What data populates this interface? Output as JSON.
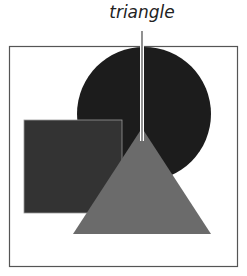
{
  "diagram": {
    "callout_label": "triangle",
    "shapes": [
      {
        "name": "circle",
        "color": "#1c1c1c"
      },
      {
        "name": "square",
        "color": "#333333"
      },
      {
        "name": "triangle",
        "color": "#6b6b6b"
      }
    ],
    "frame_color": "#555555",
    "leader_color": "#555555"
  }
}
